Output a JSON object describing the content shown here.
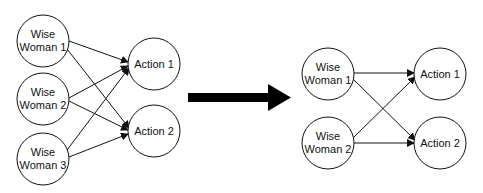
{
  "diagram": {
    "left": {
      "sources": [
        {
          "id": "lw1",
          "line1": "Wise",
          "line2": "Woman 1",
          "cx": 43,
          "cy": 41
        },
        {
          "id": "lw2",
          "line1": "Wise",
          "line2": "Woman 2",
          "cx": 43,
          "cy": 99
        },
        {
          "id": "lw3",
          "line1": "Wise",
          "line2": "Woman 3",
          "cx": 43,
          "cy": 159
        }
      ],
      "targets": [
        {
          "id": "la1",
          "label": "Action 1",
          "cx": 154,
          "cy": 64
        },
        {
          "id": "la2",
          "label": "Action 2",
          "cx": 154,
          "cy": 131
        }
      ]
    },
    "transition_arrow": {
      "label": "transforms-to",
      "color": "#000000"
    },
    "right": {
      "sources": [
        {
          "id": "rw1",
          "line1": "Wise",
          "line2": "Woman 1",
          "cx": 328,
          "cy": 74
        },
        {
          "id": "rw2",
          "line1": "Wise",
          "line2": "Woman 2",
          "cx": 328,
          "cy": 143
        }
      ],
      "targets": [
        {
          "id": "ra1",
          "label": "Action 1",
          "cx": 440,
          "cy": 74
        },
        {
          "id": "ra2",
          "label": "Action 2",
          "cx": 440,
          "cy": 143
        }
      ]
    },
    "node_radius": 26,
    "stroke_color": "#111111"
  }
}
